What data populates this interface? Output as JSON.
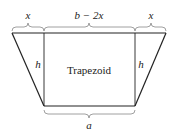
{
  "diagram": {
    "title": "Trapezoid",
    "shape_label": "Trapezoid",
    "labels": {
      "top_left": "x",
      "top_middle": "b − 2x",
      "top_right": "x",
      "left_height": "h",
      "right_height": "h",
      "bottom": "a"
    },
    "colors": {
      "line": "#222222",
      "brace": "#777777",
      "background": "#ffffff"
    }
  }
}
